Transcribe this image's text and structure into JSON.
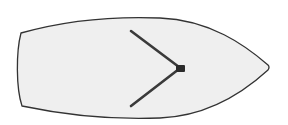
{
  "diagram": {
    "description": "Top view of a sailboat hull with mast and two spreader/shroud lines",
    "colors": {
      "background": "#ffffff",
      "hull_fill": "#efefef",
      "hull_outline": "#333333",
      "rig_line": "#3a3a3a",
      "mast": "#2b2b2b"
    },
    "hull": {
      "stern_top": [
        21,
        33
      ],
      "stern_bottom": [
        22,
        106
      ],
      "bow_tip": [
        268,
        67
      ]
    },
    "rig": {
      "mast_center": [
        180,
        68
      ],
      "upper_line": {
        "from": [
          131,
          31
        ],
        "to": [
          179,
          67
        ]
      },
      "lower_line": {
        "from": [
          131,
          106
        ],
        "to": [
          179,
          69
        ]
      }
    },
    "labels": []
  }
}
